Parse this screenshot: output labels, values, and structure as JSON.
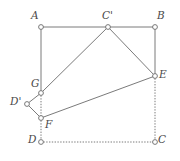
{
  "figure": {
    "width": 180,
    "height": 161,
    "background_color": "#ffffff",
    "stroke_color": "#6b6b6b",
    "label_color": "#4a4a4a",
    "marker_fill": "#ffffff",
    "solid_stroke_width": 0.9,
    "dotted_stroke_width": 0.9,
    "marker_radius": 2.4
  },
  "points": [
    {
      "id": "A",
      "label": "A",
      "x": 41,
      "y": 27,
      "label_x": 31,
      "label_y": 10,
      "marker": "circle"
    },
    {
      "id": "Cp",
      "label": "C'",
      "x": 108,
      "y": 27,
      "label_x": 102,
      "label_y": 10,
      "marker": "circle"
    },
    {
      "id": "B",
      "label": "B",
      "x": 155,
      "y": 27,
      "label_x": 157,
      "label_y": 10,
      "marker": "circle"
    },
    {
      "id": "E",
      "label": "E",
      "x": 155,
      "y": 76,
      "label_x": 159,
      "label_y": 69,
      "marker": "circle"
    },
    {
      "id": "G",
      "label": "G",
      "x": 41,
      "y": 93,
      "label_x": 31,
      "label_y": 78,
      "marker": "circle"
    },
    {
      "id": "Dp",
      "label": "D'",
      "x": 27,
      "y": 104,
      "label_x": 10,
      "label_y": 96,
      "marker": "circle"
    },
    {
      "id": "F",
      "label": "F",
      "x": 41,
      "y": 118,
      "label_x": 45,
      "label_y": 119,
      "marker": "circle"
    },
    {
      "id": "D",
      "label": "D",
      "x": 41,
      "y": 142,
      "label_x": 28,
      "label_y": 134,
      "marker": "circle"
    },
    {
      "id": "C",
      "label": "C",
      "x": 155,
      "y": 142,
      "label_x": 158,
      "label_y": 134,
      "marker": "circle"
    }
  ],
  "edges": [
    {
      "id": "A-Cp",
      "from": "A",
      "to": "Cp",
      "style": "solid"
    },
    {
      "id": "Cp-B",
      "from": "Cp",
      "to": "B",
      "style": "solid"
    },
    {
      "id": "A-G",
      "from": "A",
      "to": "G",
      "style": "solid"
    },
    {
      "id": "B-E",
      "from": "B",
      "to": "E",
      "style": "solid"
    },
    {
      "id": "Cp-G",
      "from": "Cp",
      "to": "G",
      "style": "solid"
    },
    {
      "id": "Cp-E",
      "from": "Cp",
      "to": "E",
      "style": "solid"
    },
    {
      "id": "G-Dp",
      "from": "G",
      "to": "Dp",
      "style": "solid"
    },
    {
      "id": "Dp-F",
      "from": "Dp",
      "to": "F",
      "style": "solid"
    },
    {
      "id": "F-E",
      "from": "F",
      "to": "E",
      "style": "solid"
    },
    {
      "id": "G-F",
      "from": "G",
      "to": "F",
      "style": "dotted"
    },
    {
      "id": "F-D",
      "from": "F",
      "to": "D",
      "style": "dotted"
    },
    {
      "id": "E-C",
      "from": "E",
      "to": "C",
      "style": "dotted"
    },
    {
      "id": "D-C",
      "from": "D",
      "to": "C",
      "style": "dotted"
    }
  ]
}
